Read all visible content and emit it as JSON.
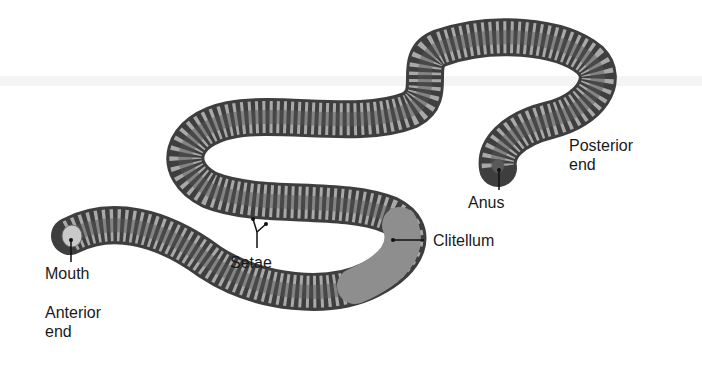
{
  "diagram": {
    "colors": {
      "background": "#ffffff",
      "body_dark": "#4a4a4a",
      "body_mid": "#7a7a7a",
      "body_light": "#b8b8b8",
      "clitellum": "#8c8c8c",
      "label_text": "#1a1a1a",
      "leader_line": "#111111"
    },
    "labels": {
      "mouth": "Mouth",
      "anterior_end": "Anterior\nend",
      "setae": "Setae",
      "clitellum": "Clitellum",
      "anus": "Anus",
      "posterior_end": "Posterior\nend"
    }
  }
}
